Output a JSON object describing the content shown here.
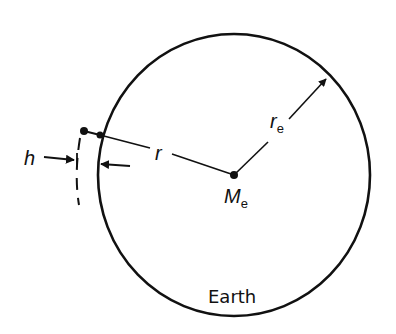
{
  "diagram": {
    "type": "geometry",
    "labels": {
      "h": "h",
      "r": "r",
      "r_e_main": "r",
      "r_e_sub": "e",
      "M_e_main": "M",
      "M_e_sub": "e",
      "earth": "Earth"
    },
    "colors": {
      "stroke": "#111111",
      "background": "#ffffff"
    }
  }
}
